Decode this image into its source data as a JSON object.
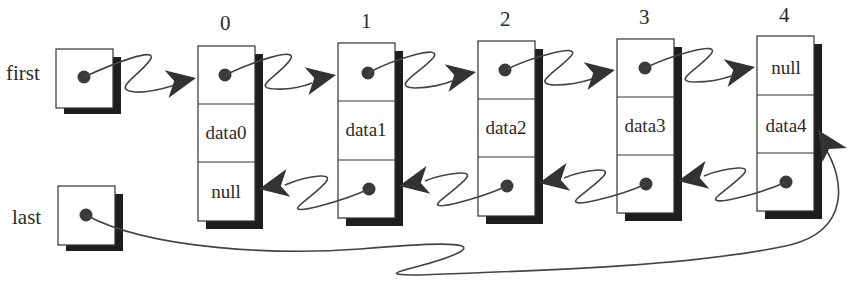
{
  "diagram": {
    "type": "doubly-linked-list",
    "pointers": [
      {
        "name": "first",
        "label": "first",
        "points_to": "node0.next-field"
      },
      {
        "name": "last",
        "label": "last",
        "points_to": "node4.data-field"
      }
    ],
    "nodes": [
      {
        "index": "0",
        "next": "•",
        "data": "data0",
        "prev": "null"
      },
      {
        "index": "1",
        "next": "•",
        "data": "data1",
        "prev": "•"
      },
      {
        "index": "2",
        "next": "•",
        "data": "data2",
        "prev": "•"
      },
      {
        "index": "3",
        "next": "•",
        "data": "data3",
        "prev": "•"
      },
      {
        "index": "4",
        "next": "null",
        "data": "data4",
        "prev": "•"
      }
    ],
    "colors": {
      "ink": "#2a2a2a",
      "shadow": "#1e1e1e",
      "dot": "#3a3a3a",
      "background": "#ffffff"
    }
  }
}
